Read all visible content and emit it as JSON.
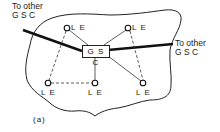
{
  "diagram": {
    "caption": "(a)",
    "hub": {
      "label": "G S C"
    },
    "external_links": [
      {
        "label": "To other\nG S C",
        "side": "left"
      },
      {
        "label": "To other\nG S C",
        "side": "right"
      }
    ],
    "nodes": [
      {
        "id": "le-top-left",
        "label": "L E"
      },
      {
        "id": "le-top-right",
        "label": "L E"
      },
      {
        "id": "le-bottom-left",
        "label": "L E"
      },
      {
        "id": "le-bottom-middle",
        "label": "L E"
      },
      {
        "id": "le-bottom-right",
        "label": "L E"
      }
    ],
    "edges": {
      "solid": [
        [
          "le-top-left",
          "gsc"
        ],
        [
          "le-top-right",
          "gsc"
        ],
        [
          "le-bottom-middle",
          "gsc"
        ],
        [
          "le-bottom-right",
          "gsc"
        ]
      ],
      "dashed": [
        [
          "le-top-left",
          "le-bottom-left"
        ],
        [
          "le-bottom-left",
          "le-bottom-middle"
        ],
        [
          "le-top-right",
          "le-bottom-right"
        ]
      ],
      "thick_external": [
        [
          "external-left",
          "gsc"
        ],
        [
          "gsc",
          "external-right"
        ]
      ]
    }
  }
}
